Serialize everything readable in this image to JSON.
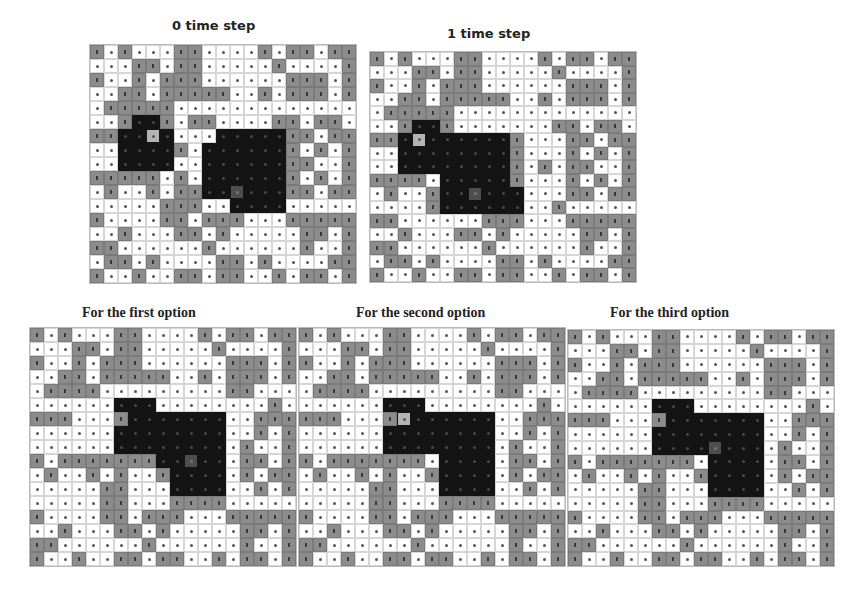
{
  "legend": {
    "0": "free cell (white)",
    "1": "occupied cell (gray)",
    "2": "region cell (black)",
    "3": "agent/source cell (light gray)",
    "4": "target cell (dark gray)"
  },
  "colors": {
    "white": "#ffffff",
    "gray": "#8c8c8c",
    "black": "#141414",
    "light": "#b4b4b4",
    "dark": "#4e4e4e"
  },
  "panels": [
    {
      "id": "t0",
      "title": "0 time step",
      "title_style": "sans",
      "title_pos": [
        172,
        18
      ],
      "grid_pos": [
        89,
        44
      ],
      "cell": [
        14,
        14
      ],
      "rows": [
        "1010001100001011011",
        "0001101100000100001",
        "1001011100000011101",
        "0011011111001011101",
        "0111110000000000000",
        "0012210110000110110",
        "1122320002222211011",
        "0022221022222210101",
        "0022220022222211001",
        "1111101022222210101",
        "0100101122422211011",
        "0000011100222200000",
        "1000011011100011111",
        "0010001101000001101",
        "1100000010000001001",
        "0110100001101000011",
        "1001001101100101101"
      ]
    },
    {
      "id": "t1",
      "title": "1 time step",
      "title_style": "sans",
      "title_pos": [
        447,
        26
      ],
      "grid_pos": [
        369,
        51
      ],
      "cell": [
        14,
        13.5
      ],
      "rows": [
        "1010001100001011011",
        "0001101100000100001",
        "1001011100000011101",
        "0011011111001011101",
        "0111110000000000000",
        "0012210000000110110",
        "1123222222100011011",
        "0022222222100010101",
        "0022222222101011001",
        "1111022222100010101",
        "0100122422200011011",
        "0000122222200100000",
        "1100000011100011111",
        "0010001101000001101",
        "1100000010000001001",
        "0110100001101000011",
        "1001001101100101101"
      ]
    },
    {
      "id": "opt1",
      "title": "For the first option",
      "title_style": "serif",
      "title_pos": [
        82,
        305
      ],
      "grid_pos": [
        29,
        327
      ],
      "cell": [
        14,
        14
      ],
      "rows": [
        "1010001100001011011",
        "0001101100000100001",
        "1001011100000011101",
        "0011011111001011101",
        "0111100000000011000",
        "0000002220000000010",
        "1110001222222200111",
        "0000002222222200101",
        "0000002222222201001",
        "1011111112242201101",
        "0100101001222201011",
        "0000011000222200101",
        "0000011000111100000",
        "1000011011100011111",
        "0010001101000001101",
        "1100000010000001001",
        "1001001101100101101"
      ]
    },
    {
      "id": "opt2",
      "title": "For the second option",
      "title_style": "serif",
      "title_pos": [
        356,
        305
      ],
      "grid_pos": [
        298,
        327
      ],
      "cell": [
        14,
        14
      ],
      "rows": [
        "1010001100001011011",
        "0001101100000100001",
        "1001011100000011101",
        "0011011111001011101",
        "0111100000000011000",
        "0000002220000000010",
        "1110001322222200111",
        "0000002222222200101",
        "0000002222222201001",
        "1011111110222201101",
        "0100101001222201011",
        "0000011000222200101",
        "0000011000111100000",
        "1000011011100011111",
        "0010001101000001101",
        "1100000010000001001",
        "1001001101100101101"
      ]
    },
    {
      "id": "opt3",
      "title": "For the third option",
      "title_style": "serif",
      "title_pos": [
        610,
        305
      ],
      "grid_pos": [
        567,
        329
      ],
      "cell": [
        14,
        13.9
      ],
      "rows": [
        "1010001100001011011",
        "0001101100000100001",
        "1001011100000011101",
        "0011011111001011101",
        "0111100000000011000",
        "0000002220000000010",
        "1110001222222200111",
        "0000002222222200101",
        "0000002222422201001",
        "1011111110222201101",
        "0100101001222201011",
        "0000011000222200101",
        "0000011000111100000",
        "1000011011100011111",
        "0010001101000001101",
        "1100000010000001001",
        "1001001101100101101"
      ]
    }
  ]
}
